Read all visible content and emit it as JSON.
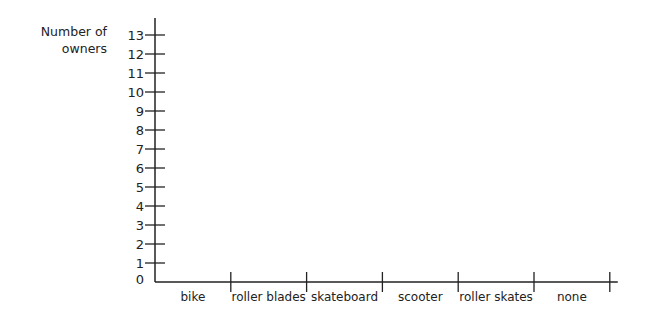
{
  "chart_data": {
    "type": "bar",
    "title": "",
    "xlabel": "",
    "ylabel": "Number of owners",
    "ylabel_lines": [
      "Number of",
      "owners"
    ],
    "categories": [
      "bike",
      "roller blades",
      "skateboard",
      "scooter",
      "roller skates",
      "none"
    ],
    "values": [
      null,
      null,
      null,
      null,
      null,
      null
    ],
    "yticks": [
      0,
      1,
      2,
      3,
      4,
      5,
      6,
      7,
      8,
      9,
      10,
      11,
      12,
      13
    ],
    "ylim": [
      0,
      13
    ],
    "grid": false,
    "legend": null,
    "note": "Blank bar chart template with no bars drawn"
  },
  "colors": {
    "axis": "#222222",
    "background": "#ffffff"
  }
}
